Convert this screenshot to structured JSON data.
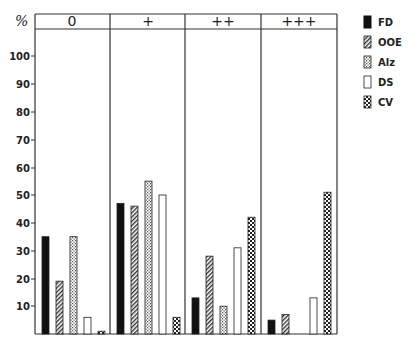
{
  "chart_data": {
    "type": "bar",
    "title": "",
    "ylabel": "%",
    "xlabel": "",
    "ylim": [
      0,
      110
    ],
    "yticks": [
      10,
      20,
      30,
      40,
      50,
      60,
      70,
      80,
      90,
      100
    ],
    "grid": false,
    "legend_position": "right",
    "categories": [
      "0",
      "+",
      "++",
      "+++"
    ],
    "series": [
      {
        "name": "FD",
        "pattern": "solid-black",
        "values": [
          35,
          47,
          13,
          5
        ]
      },
      {
        "name": "OOE",
        "pattern": "diagonal-hatch",
        "values": [
          19,
          46,
          28,
          7
        ]
      },
      {
        "name": "Alz",
        "pattern": "fine-dots",
        "values": [
          35,
          55,
          10,
          0
        ]
      },
      {
        "name": "DS",
        "pattern": "white",
        "values": [
          6,
          50,
          31,
          13
        ]
      },
      {
        "name": "CV",
        "pattern": "checker",
        "values": [
          1,
          6,
          42,
          51
        ]
      }
    ]
  },
  "labels": {
    "y_unit": "%",
    "headers": [
      "0",
      "+",
      "++",
      "+++"
    ],
    "ticks": [
      "100",
      "90",
      "80",
      "70",
      "60",
      "50",
      "40",
      "30",
      "20",
      "10"
    ],
    "legend": [
      "FD",
      "OOE",
      "Alz",
      "DS",
      "CV"
    ]
  }
}
